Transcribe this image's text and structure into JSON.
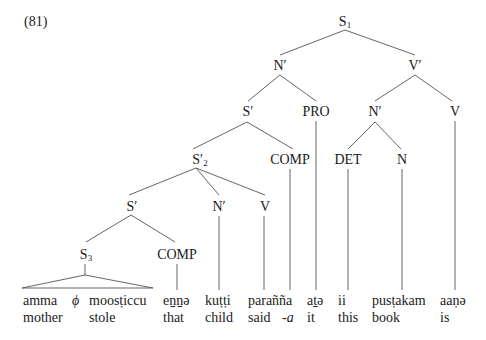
{
  "example_number": "(81)",
  "nodes": {
    "s1": {
      "label": "S",
      "sub": "1"
    },
    "n_bar_top": {
      "label": "N′"
    },
    "v_bar_top": {
      "label": "V′"
    },
    "s_bar_1": {
      "label": "S′"
    },
    "pro": {
      "label": "PRO"
    },
    "n_bar_obj": {
      "label": "N′"
    },
    "v_top": {
      "label": "V"
    },
    "s_bar_2": {
      "label": "S′",
      "sub": "2"
    },
    "comp_1": {
      "label": "COMP"
    },
    "det": {
      "label": "DET"
    },
    "n": {
      "label": "N"
    },
    "s_bar_3": {
      "label": "S′"
    },
    "n_bar_child": {
      "label": "N′"
    },
    "v_said": {
      "label": "V"
    },
    "s3": {
      "label": "S",
      "sub": "3"
    },
    "comp_2": {
      "label": "COMP"
    }
  },
  "words": [
    {
      "form": "amma",
      "gloss": "mother"
    },
    {
      "form": "ϕ",
      "gloss": ""
    },
    {
      "form": "moosṭiccu",
      "gloss": "stole"
    },
    {
      "form": "eṉṉə",
      "gloss": "that"
    },
    {
      "form": "kuṭṭi",
      "gloss": "child"
    },
    {
      "form": "parañña",
      "gloss": "said"
    },
    {
      "form": "",
      "gloss": "-a"
    },
    {
      "form": "aṯə",
      "gloss": "it"
    },
    {
      "form": "ii",
      "gloss": "this"
    },
    {
      "form": "pusṭakam",
      "gloss": "book"
    },
    {
      "form": "aaṇə",
      "gloss": "is"
    }
  ]
}
